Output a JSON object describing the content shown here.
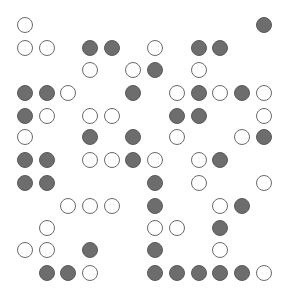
{
  "board": {
    "rows": 12,
    "cols": 12,
    "col_x": [
      25,
      47,
      68,
      90,
      112,
      133,
      155,
      177,
      199,
      220,
      242,
      264
    ],
    "row_y": [
      25,
      48,
      70,
      93,
      116,
      137,
      160,
      183,
      206,
      228,
      250,
      273
    ],
    "colors": {
      "filled": "#6d6d6d",
      "filled_border": "#5a5a5a",
      "open_border": "#6a6a6a",
      "background": "#ffffff"
    },
    "legend": {
      "F": "filled",
      "O": "open",
      ".": "empty"
    },
    "grid": [
      "O..........F",
      "OO.FF.O.FF..",
      "...O.OF.O...",
      "FFO..F.OFOFO",
      "FO.OO..FF..O",
      "O..F.F.O..OF",
      "FF.OOFO.OF..",
      "FF....F.O..O",
      "..OOO.F..OF.",
      ".O....OO.F..",
      "OO.F..F..O..",
      ".FFO..FFFFFO"
    ]
  }
}
